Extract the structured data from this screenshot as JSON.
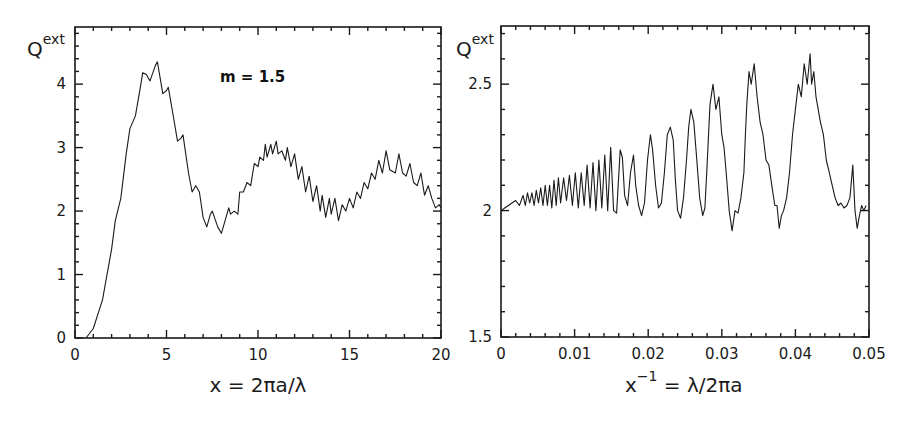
{
  "chart_data": [
    {
      "type": "line",
      "title": "",
      "annotation": "m = 1.5",
      "xlabel": "x = 2πa/λ",
      "ylabel": "Q",
      "ylabel_sup": "ext",
      "xlim": [
        0,
        20
      ],
      "ylim": [
        0,
        4.9
      ],
      "xticks": [
        0,
        5,
        10,
        15,
        20
      ],
      "xtick_labels": [
        "0",
        "5",
        "10",
        "15",
        "20"
      ],
      "x_minor_step": 1,
      "yticks": [
        0,
        1,
        2,
        3,
        4
      ],
      "ytick_labels": [
        "0",
        "1",
        "2",
        "3",
        "4"
      ],
      "y_minor_step": 0.2,
      "grid": false,
      "series": [
        {
          "name": "Q_ext (m = 1.5)",
          "x": [
            0.6,
            1,
            1.5,
            2,
            2.2,
            2.5,
            2.8,
            3.0,
            3.3,
            3.6,
            3.7,
            3.9,
            4.1,
            4.4,
            4.5,
            4.8,
            5.0,
            5.1,
            5.4,
            5.6,
            5.8,
            5.9,
            6.2,
            6.4,
            6.6,
            6.8,
            7.0,
            7.2,
            7.4,
            7.5,
            7.8,
            8.0,
            8.2,
            8.4,
            8.5,
            8.7,
            8.9,
            9.0,
            9.2,
            9.4,
            9.6,
            9.8,
            10.0,
            10.1,
            10.3,
            10.4,
            10.5,
            10.7,
            10.8,
            11.0,
            11.1,
            11.3,
            11.5,
            11.6,
            11.8,
            12.0,
            12.2,
            12.4,
            12.6,
            12.8,
            13.0,
            13.2,
            13.4,
            13.5,
            13.7,
            13.9,
            14.0,
            14.2,
            14.4,
            14.6,
            14.8,
            15.0,
            15.2,
            15.4,
            15.6,
            15.8,
            16.0,
            16.2,
            16.4,
            16.6,
            16.8,
            17.0,
            17.2,
            17.5,
            17.7,
            17.9,
            18.1,
            18.3,
            18.5,
            18.7,
            18.9,
            19.1,
            19.3,
            19.5,
            19.7,
            19.9,
            20.0
          ],
          "y": [
            0,
            0.15,
            0.6,
            1.4,
            1.85,
            2.2,
            2.9,
            3.3,
            3.5,
            4.0,
            4.18,
            4.15,
            4.05,
            4.3,
            4.35,
            3.85,
            3.9,
            3.95,
            3.45,
            3.1,
            3.15,
            3.2,
            2.6,
            2.3,
            2.4,
            2.3,
            1.9,
            1.75,
            1.95,
            2.0,
            1.75,
            1.65,
            1.85,
            2.05,
            1.95,
            2.0,
            1.95,
            2.3,
            2.3,
            2.45,
            2.4,
            2.75,
            2.7,
            2.85,
            2.8,
            3.05,
            2.85,
            3.05,
            2.9,
            3.1,
            2.9,
            2.95,
            2.8,
            3.0,
            2.7,
            2.9,
            2.5,
            2.7,
            2.3,
            2.55,
            2.15,
            2.4,
            2.0,
            2.25,
            1.9,
            2.2,
            1.95,
            2.2,
            1.85,
            2.1,
            2.0,
            2.2,
            2.05,
            2.3,
            2.2,
            2.45,
            2.35,
            2.6,
            2.5,
            2.8,
            2.6,
            2.95,
            2.65,
            2.6,
            2.9,
            2.6,
            2.55,
            2.75,
            2.45,
            2.4,
            2.6,
            2.25,
            2.4,
            2.2,
            2.05,
            2.1,
            2.05
          ]
        }
      ]
    },
    {
      "type": "line",
      "title": "",
      "xlabel": "x⁻¹ = λ/2πa",
      "xlabel_main": "x",
      "xlabel_sup": "−1",
      "xlabel_rest": " = λ/2πa",
      "ylabel": "Q",
      "ylabel_sup": "ext",
      "xlim": [
        0,
        0.05
      ],
      "ylim": [
        1.5,
        2.73
      ],
      "xticks": [
        0,
        0.01,
        0.02,
        0.03,
        0.04,
        0.05
      ],
      "xtick_labels": [
        "0",
        "0.01",
        "0.02",
        "0.03",
        "0.04",
        "0.05"
      ],
      "x_minor_step": 0.002,
      "yticks": [
        1.5,
        2,
        2.5
      ],
      "ytick_labels": [
        "1.5",
        "2",
        "2.5"
      ],
      "y_minor_step": 0.1,
      "grid": false,
      "series": [
        {
          "name": "Q_ext vs inverse size parameter",
          "x": [
            0,
            0.0005,
            0.001,
            0.0015,
            0.002,
            0.0025,
            0.003,
            0.0033,
            0.0036,
            0.0039,
            0.0042,
            0.0045,
            0.0048,
            0.0051,
            0.0054,
            0.0057,
            0.006,
            0.0063,
            0.0066,
            0.0069,
            0.0072,
            0.0075,
            0.0078,
            0.0081,
            0.0085,
            0.0089,
            0.0093,
            0.0097,
            0.0101,
            0.0105,
            0.0109,
            0.0113,
            0.0117,
            0.0121,
            0.0125,
            0.0129,
            0.0133,
            0.0137,
            0.0141,
            0.0145,
            0.0149,
            0.0153,
            0.0157,
            0.0162,
            0.0165,
            0.0168,
            0.0172,
            0.0176,
            0.018,
            0.0183,
            0.0187,
            0.0191,
            0.0195,
            0.0199,
            0.0203,
            0.0206,
            0.021,
            0.0214,
            0.0218,
            0.0222,
            0.0226,
            0.023,
            0.0234,
            0.0237,
            0.024,
            0.0244,
            0.0248,
            0.0252,
            0.0255,
            0.0258,
            0.0262,
            0.0266,
            0.027,
            0.0274,
            0.0277,
            0.028,
            0.0284,
            0.0288,
            0.0292,
            0.0296,
            0.03,
            0.0303,
            0.0306,
            0.031,
            0.0314,
            0.0318,
            0.0322,
            0.0326,
            0.033,
            0.0332,
            0.0334,
            0.0337,
            0.034,
            0.0344,
            0.0348,
            0.0352,
            0.0356,
            0.036,
            0.0364,
            0.0368,
            0.0372,
            0.0375,
            0.0378,
            0.0381,
            0.0384,
            0.0388,
            0.0392,
            0.0396,
            0.04,
            0.0404,
            0.0408,
            0.0412,
            0.0416,
            0.042,
            0.0422,
            0.0425,
            0.0428,
            0.0431,
            0.0434,
            0.0438,
            0.0442,
            0.0446,
            0.045,
            0.0454,
            0.0458,
            0.0462,
            0.0466,
            0.047,
            0.0474,
            0.0478,
            0.0481,
            0.0484,
            0.0487,
            0.049,
            0.0493,
            0.0496,
            0.05
          ],
          "y": [
            2.0,
            2.01,
            2.02,
            2.03,
            2.04,
            2.02,
            2.06,
            2.02,
            2.07,
            2.03,
            2.07,
            2.02,
            2.08,
            2.03,
            2.09,
            2.02,
            2.1,
            2.02,
            2.1,
            2.01,
            2.12,
            2.02,
            2.13,
            2.03,
            2.13,
            2.04,
            2.14,
            2.02,
            2.15,
            2.01,
            2.15,
            2.02,
            2.18,
            2.01,
            2.19,
            2.0,
            2.2,
            2.01,
            2.22,
            2.0,
            2.25,
            2.0,
            1.99,
            2.24,
            2.21,
            2.06,
            2.02,
            2.15,
            2.22,
            2.1,
            2.02,
            1.98,
            2.03,
            2.2,
            2.3,
            2.24,
            2.1,
            2.01,
            2.03,
            2.15,
            2.3,
            2.33,
            2.28,
            2.12,
            2.0,
            1.97,
            2.05,
            2.2,
            2.33,
            2.4,
            2.35,
            2.2,
            2.05,
            1.98,
            2.01,
            2.18,
            2.42,
            2.5,
            2.4,
            2.45,
            2.3,
            2.25,
            2.15,
            2.0,
            1.92,
            2.0,
            1.99,
            2.05,
            2.15,
            2.3,
            2.42,
            2.55,
            2.5,
            2.58,
            2.45,
            2.35,
            2.3,
            2.2,
            2.18,
            2.1,
            2.02,
            2.02,
            1.93,
            1.98,
            2.0,
            2.05,
            2.15,
            2.3,
            2.4,
            2.5,
            2.45,
            2.58,
            2.5,
            2.62,
            2.5,
            2.55,
            2.45,
            2.4,
            2.35,
            2.3,
            2.2,
            2.15,
            2.1,
            2.05,
            2.02,
            2.03,
            2.01,
            2.02,
            2.05,
            2.18,
            2.0,
            1.93,
            1.98,
            2.02,
            2.0,
            2.02
          ]
        }
      ]
    }
  ]
}
